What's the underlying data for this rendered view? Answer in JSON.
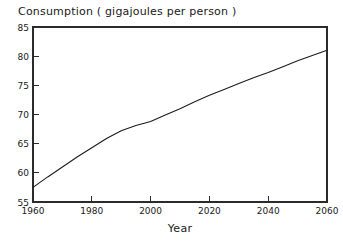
{
  "chart_data": {
    "type": "line",
    "title": "Consumption  ( gigajoules per person )",
    "xlabel": "Year",
    "ylabel": "",
    "xlim": [
      1960,
      2060
    ],
    "ylim": [
      55,
      85
    ],
    "grid": false,
    "legend": false,
    "x_ticks": [
      1960,
      1980,
      2000,
      2020,
      2040,
      2060
    ],
    "x_tick_labels": [
      "1960",
      "1980",
      "2000",
      "2020",
      "2040",
      "2060"
    ],
    "y_ticks": [
      55,
      60,
      65,
      70,
      75,
      80,
      85
    ],
    "y_tick_labels": [
      "55",
      "60",
      "65",
      "70",
      "75",
      "80",
      "85"
    ],
    "series": [
      {
        "name": "Consumption",
        "color": "#1c1c1c",
        "x": [
          1960,
          1965,
          1970,
          1975,
          1980,
          1985,
          1990,
          1995,
          2000,
          2005,
          2010,
          2015,
          2020,
          2025,
          2030,
          2035,
          2040,
          2045,
          2050,
          2055,
          2060
        ],
        "values": [
          57.5,
          59.3,
          61.0,
          62.7,
          64.3,
          65.9,
          67.2,
          68.1,
          68.8,
          69.9,
          71.0,
          72.2,
          73.3,
          74.3,
          75.3,
          76.3,
          77.2,
          78.2,
          79.2,
          80.1,
          81.0
        ]
      }
    ]
  },
  "axes": {
    "x_axis_title": "Year"
  }
}
